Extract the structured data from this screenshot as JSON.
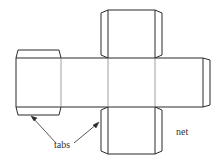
{
  "diagram": {
    "title": "net",
    "labels": {
      "tabs": "tabs",
      "net": "net"
    },
    "colors": {
      "stroke": "#2a2a2a",
      "fold": "#888888",
      "background": "#ffffff"
    },
    "parts": [
      {
        "id": "left-face",
        "kind": "face"
      },
      {
        "id": "left-face-top-tab",
        "kind": "tab"
      },
      {
        "id": "left-face-bottom-tab",
        "kind": "tab"
      },
      {
        "id": "middle-left-face",
        "kind": "face"
      },
      {
        "id": "center-face",
        "kind": "face"
      },
      {
        "id": "right-face",
        "kind": "face"
      },
      {
        "id": "right-tab",
        "kind": "tab"
      },
      {
        "id": "top-face",
        "kind": "face"
      },
      {
        "id": "top-face-left-tab",
        "kind": "tab"
      },
      {
        "id": "top-face-right-tab",
        "kind": "tab"
      },
      {
        "id": "bottom-face",
        "kind": "face"
      },
      {
        "id": "bottom-face-left-tab",
        "kind": "tab"
      },
      {
        "id": "bottom-face-right-tab",
        "kind": "tab"
      }
    ]
  }
}
